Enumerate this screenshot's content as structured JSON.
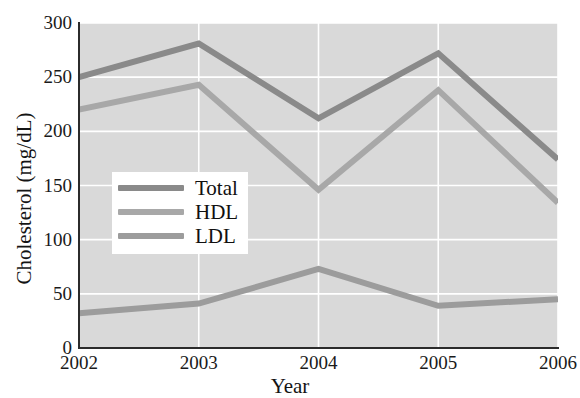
{
  "chart_data": {
    "type": "line",
    "title": "",
    "xlabel": "Year",
    "ylabel": "Cholesterol (mg/dL)",
    "categories": [
      "2002",
      "2003",
      "2004",
      "2005",
      "2006"
    ],
    "x": [
      2002,
      2003,
      2004,
      2005,
      2006
    ],
    "xlim": [
      2002,
      2006
    ],
    "ylim": [
      0,
      300
    ],
    "yticks": [
      0,
      50,
      100,
      150,
      200,
      250,
      300
    ],
    "ytick_labels": [
      "0",
      "50",
      "100",
      "150",
      "200",
      "250",
      "300"
    ],
    "xtick_labels": [
      "2002",
      "2003",
      "2004",
      "2005",
      "2006"
    ],
    "grid": true,
    "grid_color": "#ffffff",
    "plot_background": "#d9d9d9",
    "legend_position": "center-left",
    "series": [
      {
        "name": "Total",
        "color": "#8a8a8a",
        "values": [
          250,
          281,
          212,
          272,
          174
        ]
      },
      {
        "name": "HDL",
        "color": "#a8a8a8",
        "values": [
          220,
          243,
          146,
          238,
          134
        ]
      },
      {
        "name": "LDL",
        "color": "#9c9c9c",
        "values": [
          32,
          41,
          73,
          39,
          45
        ]
      }
    ]
  },
  "legend": {
    "items": [
      {
        "label": "Total",
        "color": "#8a8a8a"
      },
      {
        "label": "HDL",
        "color": "#a8a8a8"
      },
      {
        "label": "LDL",
        "color": "#9c9c9c"
      }
    ]
  },
  "artifacts": {
    "top_ghost": "",
    "mid_ghost": "",
    "low_ghost": ""
  }
}
